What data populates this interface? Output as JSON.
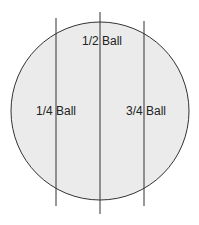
{
  "diagram": {
    "colors": {
      "fill": "#ebebeb",
      "stroke": "#333333",
      "text": "#222222"
    },
    "ball": {
      "cx": 100,
      "cy": 111,
      "r": 89
    },
    "lines": [
      {
        "id": "quarter",
        "x": 56,
        "y1": 18,
        "y2": 206
      },
      {
        "id": "half",
        "x": 100,
        "y1": 12,
        "y2": 214
      },
      {
        "id": "three-quarter",
        "x": 144,
        "y1": 21,
        "y2": 206
      }
    ],
    "labels": [
      {
        "id": "half",
        "text": "1/2 Ball",
        "x": 82,
        "y": 45
      },
      {
        "id": "quarter",
        "text": "1/4 Ball",
        "x": 36,
        "y": 115
      },
      {
        "id": "three-quarter",
        "text": "3/4 Ball",
        "x": 126,
        "y": 115
      }
    ]
  }
}
